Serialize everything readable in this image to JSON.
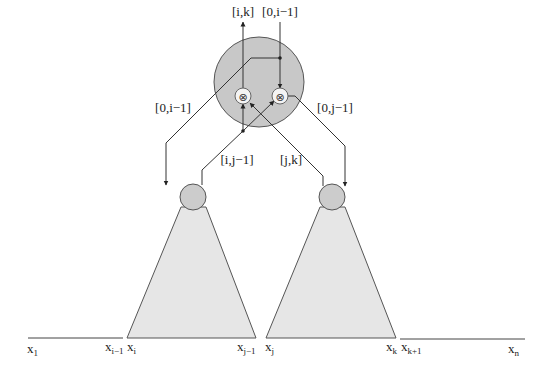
{
  "diagram": {
    "type": "tree-combine",
    "colors": {
      "big_node_fill": "#c8c8c8",
      "small_node_fill": "#cccccc",
      "subtree_fill": "#e6e6e6",
      "op_fill": "#f4f4f4",
      "line": "#333333"
    },
    "top_labels": {
      "output": "[i,k]",
      "input": "[0,i−1]"
    },
    "side_labels": {
      "left": "[0,i−1]",
      "right": "[0,j−1]"
    },
    "middle_labels": {
      "left": "[i,j−1]",
      "right": "[j,k]"
    },
    "operators": {
      "left": "⊗",
      "right": "⊗"
    },
    "leaves": [
      {
        "base": "x",
        "sub": "1"
      },
      {
        "base": "x",
        "sub": "i−1"
      },
      {
        "base": "x",
        "sub": "i"
      },
      {
        "base": "x",
        "sub": "j−1"
      },
      {
        "base": "x",
        "sub": "j"
      },
      {
        "base": "x",
        "sub": "k"
      },
      {
        "base": "x",
        "sub": "k+1"
      },
      {
        "base": "x",
        "sub": "n"
      }
    ]
  }
}
